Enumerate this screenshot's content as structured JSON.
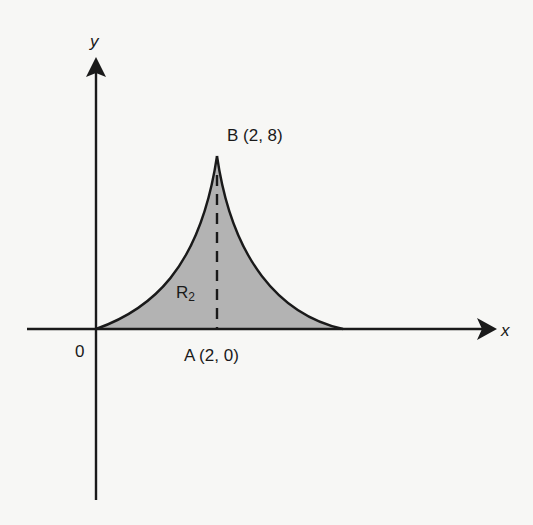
{
  "diagram": {
    "type": "region-between-curves",
    "axes": {
      "x_label": "x",
      "y_label": "y",
      "origin_label": "0"
    },
    "points": {
      "A": {
        "name": "A",
        "coords": "(2, 0)",
        "label": "A (2, 0)"
      },
      "B": {
        "name": "B",
        "coords": "(2, 8)",
        "label": "B (2, 8)"
      }
    },
    "region": {
      "name": "R",
      "subscript": "2",
      "fill_color": "#b3b3b3"
    },
    "colors": {
      "stroke": "#1a1a1a",
      "background": "#f7f7f5"
    },
    "segments": [
      {
        "name": "dashed-line-AB",
        "from": "A (2, 0)",
        "to": "B (2, 8)",
        "style": "dashed"
      }
    ]
  }
}
